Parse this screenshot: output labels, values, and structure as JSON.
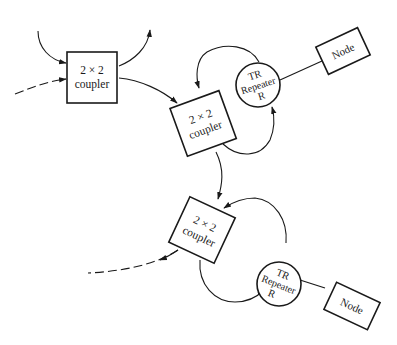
{
  "diagram": {
    "type": "optical ring network with 2x2 couplers and TR repeaters",
    "colors": {
      "stroke": "#1a1a1a",
      "background": "#ffffff"
    },
    "couplers": [
      {
        "id": "coupler-1",
        "line1": "2 × 2",
        "line2": "coupler"
      },
      {
        "id": "coupler-2",
        "line1": "2 × 2",
        "line2": "coupler"
      },
      {
        "id": "coupler-3",
        "line1": "2 × 2",
        "line2": "coupler"
      }
    ],
    "repeaters": [
      {
        "id": "repeater-1",
        "line1": "TR",
        "line2": "Repeater",
        "line3": "R"
      },
      {
        "id": "repeater-2",
        "line1": "TR",
        "line2": "Repeater",
        "line3": "R"
      }
    ],
    "nodes": [
      {
        "id": "node-1",
        "label": "Node"
      },
      {
        "id": "node-2",
        "label": "Node"
      }
    ]
  }
}
